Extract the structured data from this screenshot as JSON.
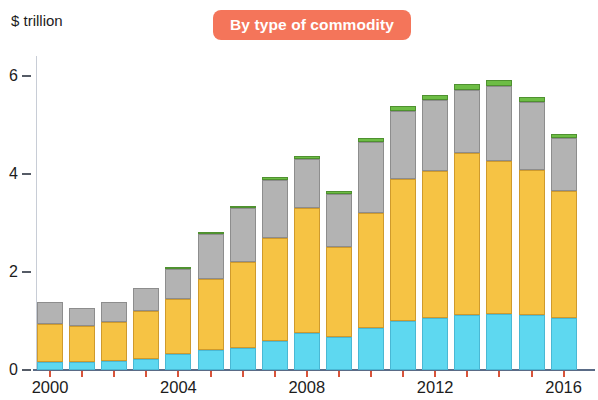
{
  "title": {
    "badge_label": "By type of commodity"
  },
  "axis": {
    "unit_label": "$ trillion",
    "y_ticks": [
      "0",
      "2",
      "4",
      "6"
    ],
    "x_ticks": [
      "2000",
      "2004",
      "2008",
      "2012",
      "2016"
    ]
  },
  "chart_data": {
    "type": "bar",
    "subtype": "stacked",
    "title": "By type of commodity",
    "xlabel": "",
    "ylabel": "$ trillion",
    "ylim": [
      0,
      6.4
    ],
    "yticks": [
      0,
      2,
      4,
      6
    ],
    "grid": false,
    "legend": "none",
    "categories": [
      "2000",
      "2001",
      "2002",
      "2003",
      "2004",
      "2005",
      "2006",
      "2007",
      "2008",
      "2009",
      "2010",
      "2011",
      "2012",
      "2013",
      "2014",
      "2015",
      "2016"
    ],
    "xtick_labels": [
      "2000",
      "2004",
      "2008",
      "2012",
      "2016"
    ],
    "series": [
      {
        "name": "Agricultural",
        "color": "#5ed8f0",
        "values": [
          0.16,
          0.16,
          0.18,
          0.22,
          0.33,
          0.4,
          0.45,
          0.6,
          0.75,
          0.68,
          0.85,
          1.0,
          1.05,
          1.12,
          1.15,
          1.12,
          1.05
        ]
      },
      {
        "name": "Energy",
        "color": "#f6c344",
        "values": [
          0.78,
          0.73,
          0.8,
          0.98,
          1.14,
          1.45,
          1.75,
          2.1,
          2.55,
          1.82,
          2.35,
          2.9,
          3.0,
          3.3,
          3.12,
          2.95,
          2.6
        ]
      },
      {
        "name": "Minerals and metals",
        "color": "#b3b3b3",
        "values": [
          0.45,
          0.38,
          0.4,
          0.48,
          0.6,
          0.92,
          1.1,
          1.18,
          1.0,
          1.08,
          1.45,
          1.38,
          1.45,
          1.28,
          1.52,
          1.4,
          1.08
        ]
      },
      {
        "name": "Other",
        "color": "#6dbd45",
        "values": [
          0.0,
          0.0,
          0.0,
          0.0,
          0.02,
          0.04,
          0.05,
          0.06,
          0.06,
          0.06,
          0.07,
          0.1,
          0.11,
          0.12,
          0.13,
          0.1,
          0.08
        ]
      }
    ],
    "totals": [
      1.39,
      1.27,
      1.38,
      1.68,
      2.09,
      2.81,
      3.35,
      3.94,
      4.36,
      3.64,
      4.72,
      5.38,
      5.61,
      5.82,
      5.92,
      5.57,
      4.81
    ]
  },
  "colors": {
    "badge": "#f4755a",
    "agricultural": "#5ed8f0",
    "energy": "#f6c344",
    "minerals": "#b3b3b3",
    "other": "#6dbd45",
    "baseline": "#5a6b86",
    "tick_mark": "#d8533a"
  }
}
